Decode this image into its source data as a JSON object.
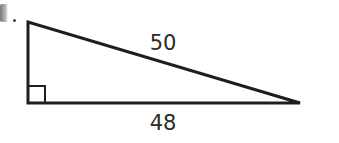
{
  "diagram": {
    "type": "right-triangle",
    "vertices": {
      "top": [
        28,
        22
      ],
      "right_angle": [
        28,
        103
      ],
      "right": [
        300,
        103
      ]
    },
    "right_angle_marker_size": 17,
    "stroke_color": "#1e1e1e",
    "labels": {
      "hypotenuse": "50",
      "base": "48"
    }
  }
}
